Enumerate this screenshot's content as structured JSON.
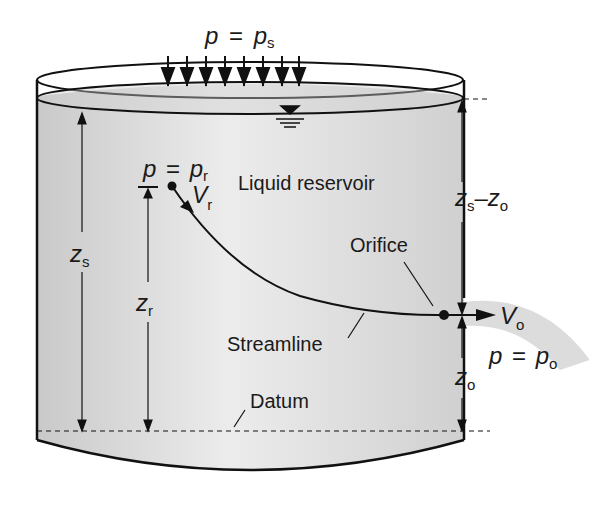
{
  "labels": {
    "surface_pressure": {
      "var": "p",
      "eq": "=",
      "sym": "p",
      "sub": "s"
    },
    "point_r_pressure": {
      "var": "p",
      "eq": "=",
      "sym": "p",
      "sub": "r"
    },
    "velocity_r": {
      "sym": "V",
      "sub": "r"
    },
    "reservoir": "Liquid reservoir",
    "orifice": "Orifice",
    "streamline": "Streamline",
    "datum": "Datum",
    "velocity_o": {
      "sym": "V",
      "sub": "o"
    },
    "outlet_pressure": {
      "var": "p",
      "eq": "=",
      "sym": "p",
      "sub": "o"
    },
    "z_s": {
      "sym": "z",
      "sub": "s"
    },
    "z_r": {
      "sym": "z",
      "sub": "r"
    },
    "z_o": {
      "sym": "z",
      "sub": "o"
    },
    "z_s_minus_z_o": {
      "a": "z",
      "a_sub": "s",
      "op": "–",
      "b": "z",
      "b_sub": "o"
    }
  },
  "colors": {
    "liquid": "#d6d6d6",
    "liquid_light": "#ececec",
    "stroke": "#111111",
    "jet": "#dcdcdc"
  }
}
